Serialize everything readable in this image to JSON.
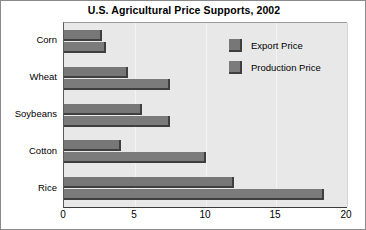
{
  "chart_data": {
    "type": "bar",
    "orientation": "horizontal",
    "title": "U.S. Agricultural Price Supports, 2002",
    "xlabel": "",
    "ylabel": "",
    "categories": [
      "Corn",
      "Wheat",
      "Soybeans",
      "Cotton",
      "Rice"
    ],
    "series": [
      {
        "name": "Export Price",
        "values": [
          2.7,
          4.5,
          5.5,
          4.0,
          12.0
        ]
      },
      {
        "name": "Production Price",
        "values": [
          3.0,
          7.5,
          7.5,
          10.0,
          18.4
        ]
      }
    ],
    "xlim": [
      0,
      20
    ],
    "xticks": [
      0,
      5,
      10,
      15,
      20
    ],
    "xtick_labels": [
      "0",
      "5",
      "10",
      "15",
      "20"
    ],
    "grid": true,
    "grid_axis": "x",
    "legend_position": "upper right",
    "colors": {
      "bar_export": "#777777",
      "bar_production": "#7b7b7b",
      "bar_shadow": "#3f3f3f",
      "plot_background": "#e8e8e8",
      "gridline": "#f4f4f4",
      "axis": "#3a3a3a",
      "frame": "#8a8a8a",
      "text": "#000000"
    }
  }
}
